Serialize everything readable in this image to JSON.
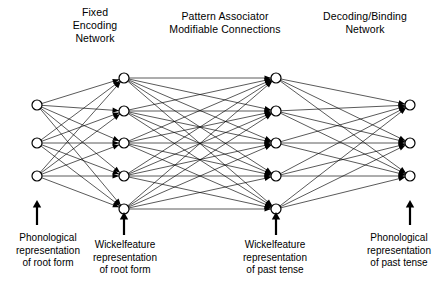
{
  "figure": {
    "type": "neural-network-architecture"
  },
  "headers": {
    "encoding": "Fixed\nEncoding\nNetwork",
    "associator": "Pattern Associator\nModifiable Connections",
    "decoding": "Decoding/Binding\nNetwork"
  },
  "captions": {
    "phonological_root": "Phonological\nrepresentation\nof root form",
    "wickelfeature_root": "Wickelfeature\nrepresentation\nof root form",
    "wickelfeature_past": "Wickelfeature\nrepresentation\nof past tense",
    "phonological_past": "Phonological\nrepresentation\nof past tense"
  },
  "network": {
    "layers": [
      {
        "name": "phonological-root-layer",
        "node_count": 3,
        "x": 37,
        "ys": [
          105,
          143,
          176
        ]
      },
      {
        "name": "wickelfeature-root-layer",
        "node_count": 5,
        "x": 124,
        "ys": [
          78,
          111,
          143,
          176,
          209
        ]
      },
      {
        "name": "wickelfeature-past-layer",
        "node_count": 5,
        "x": 276,
        "ys": [
          78,
          111,
          143,
          176,
          209
        ]
      },
      {
        "name": "phonological-past-layer",
        "node_count": 3,
        "x": 410,
        "ys": [
          105,
          143,
          176
        ]
      }
    ],
    "node_radius": 5,
    "connections": "fully-connected-between-adjacent-layers",
    "edge_color": "#000000",
    "node_fill": "#ffffff"
  },
  "input_arrows": [
    {
      "name": "arrow-phonological-root",
      "x": 37,
      "y_tail": 225,
      "y_head": 200
    },
    {
      "name": "arrow-wickelfeature-root",
      "x": 124,
      "y_tail": 235,
      "y_head": 212
    },
    {
      "name": "arrow-wickelfeature-past",
      "x": 276,
      "y_tail": 235,
      "y_head": 212
    },
    {
      "name": "arrow-phonological-past",
      "x": 410,
      "y_tail": 225,
      "y_head": 200
    }
  ]
}
